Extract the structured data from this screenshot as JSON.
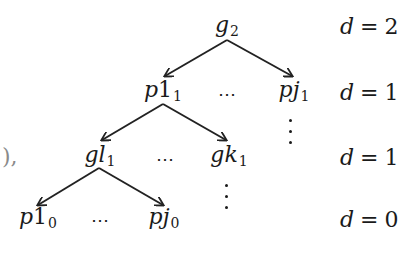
{
  "diagram": {
    "type": "tree",
    "stroke_color": "#222222",
    "text_color": "#1a1a1a",
    "left_fragment": "),",
    "nodes": [
      {
        "id": "g2",
        "base": "g",
        "letter": "",
        "sub": "2",
        "x": 227,
        "y": 26
      },
      {
        "id": "p1_1",
        "base": "p",
        "letter": "1",
        "sub": "1",
        "x": 163,
        "y": 91
      },
      {
        "id": "pj_1",
        "base": "pj",
        "letter": "",
        "sub": "1",
        "x": 294,
        "y": 91
      },
      {
        "id": "gl_1",
        "base": "gl",
        "letter": "",
        "sub": "1",
        "x": 100,
        "y": 156
      },
      {
        "id": "gk_1",
        "base": "gk",
        "letter": "",
        "sub": "1",
        "x": 229,
        "y": 156
      },
      {
        "id": "p1_0",
        "base": "p",
        "letter": "1",
        "sub": "0",
        "x": 38,
        "y": 218
      },
      {
        "id": "pj_0",
        "base": "pj",
        "letter": "",
        "sub": "0",
        "x": 164,
        "y": 218
      }
    ],
    "edges": [
      {
        "from": "g2",
        "to": "p1_1",
        "x1": 227,
        "y1": 40,
        "x2": 165,
        "y2": 76
      },
      {
        "from": "g2",
        "to": "pj_1",
        "x1": 227,
        "y1": 40,
        "x2": 292,
        "y2": 76
      },
      {
        "from": "p1_1",
        "to": "gl_1",
        "x1": 163,
        "y1": 104,
        "x2": 102,
        "y2": 140
      },
      {
        "from": "p1_1",
        "to": "gk_1",
        "x1": 163,
        "y1": 104,
        "x2": 226,
        "y2": 140
      },
      {
        "from": "gl_1",
        "to": "p1_0",
        "x1": 99,
        "y1": 168,
        "x2": 38,
        "y2": 205
      },
      {
        "from": "gl_1",
        "to": "pj_0",
        "x1": 99,
        "y1": 168,
        "x2": 163,
        "y2": 205
      }
    ],
    "h_ellipses": [
      {
        "text": "⋯",
        "x": 228,
        "y": 93
      },
      {
        "text": "⋯",
        "x": 166,
        "y": 158
      },
      {
        "text": "⋯",
        "x": 101,
        "y": 219
      }
    ],
    "v_ellipses": [
      {
        "x": 290,
        "y": 119
      },
      {
        "x": 226,
        "y": 184
      }
    ],
    "depth_labels": [
      {
        "var": "d",
        "eq": "=",
        "value": "2",
        "y": 26
      },
      {
        "var": "d",
        "eq": "=",
        "value": "1",
        "y": 92
      },
      {
        "var": "d",
        "eq": "=",
        "value": "1",
        "y": 157
      },
      {
        "var": "d",
        "eq": "=",
        "value": "0",
        "y": 219
      }
    ]
  }
}
